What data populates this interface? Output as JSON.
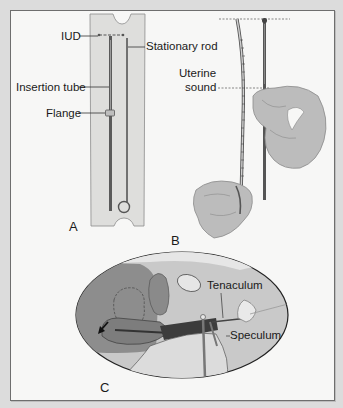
{
  "figure": {
    "panels": [
      {
        "id": "A",
        "letter": "A",
        "labels": {
          "iud": "IUD",
          "stationary_rod": "Stationary rod",
          "insertion_tube": "Insertion tube",
          "flange": "Flange"
        }
      },
      {
        "id": "B",
        "letter": "B",
        "labels": {
          "uterine_sound": "Uterine\nsound",
          "uterine_sound_line1": "Uterine",
          "uterine_sound_line2": "sound"
        }
      },
      {
        "id": "C",
        "letter": "C",
        "labels": {
          "tenaculum": "Tenaculum",
          "speculum": "Speculum"
        }
      }
    ]
  },
  "colors": {
    "background": "#dcdcdc",
    "frame": "#f7f7f6",
    "package": "#dededc",
    "tissue_dark": "#7a7a7a",
    "tissue_mid": "#a4a4a4",
    "tissue_light": "#cfcfcf",
    "glove": "#b9b9b9",
    "line": "#333333"
  }
}
